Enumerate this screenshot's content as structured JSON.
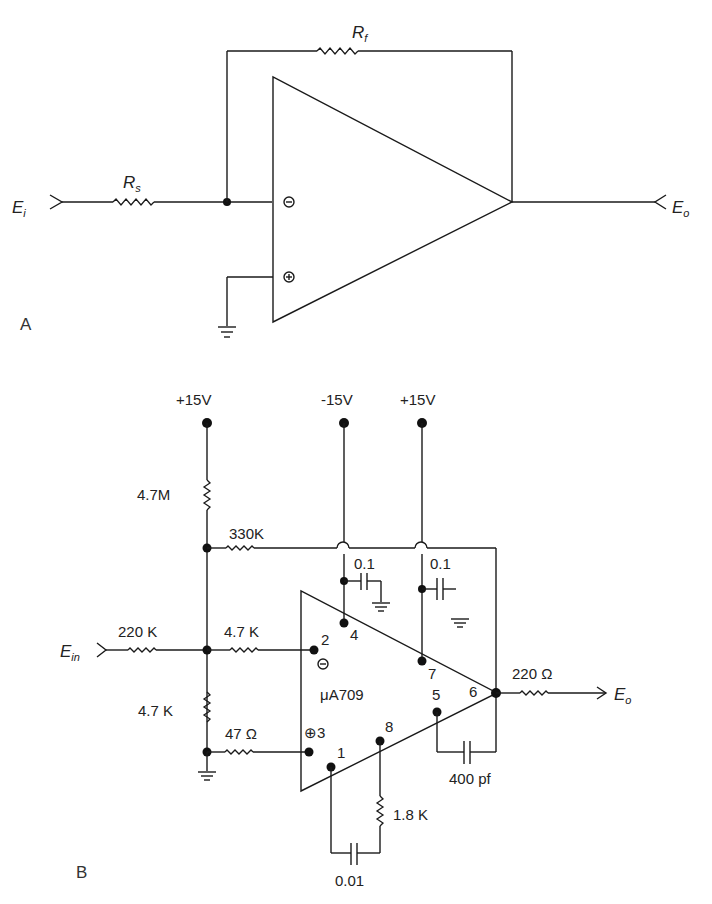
{
  "figure_a": {
    "panel_label": "A",
    "input_label": "E",
    "input_sub": "i",
    "output_label": "E",
    "output_sub": "o",
    "rs_label": "R",
    "rs_sub": "s",
    "rf_label": "R",
    "rf_sub": "f",
    "inverting_symbol": "⊖",
    "noninverting_symbol": "⊕"
  },
  "figure_b": {
    "panel_label": "B",
    "supply_left": "+15V",
    "supply_neg": "-15V",
    "supply_pos": "+15V",
    "r_top": "4.7M",
    "r_330k": "330K",
    "c_neg": "0.1",
    "c_pos": "0.1",
    "input_label": "E",
    "input_sub": "in",
    "r_in": "220 K",
    "r_series": "4.7 K",
    "r_bottom": "4.7 K",
    "r_47": "47 Ω",
    "chip": "μA709",
    "pin2": "2",
    "pin3": "⊕3",
    "pin4": "4",
    "pin7": "7",
    "pin5": "5",
    "pin6": "6",
    "pin8": "8",
    "pin1": "1",
    "inv_symbol": "⊖",
    "r_out": "220 Ω",
    "output_label": "E",
    "output_sub": "o",
    "c_400": "400 pf",
    "r_18k": "1.8 K",
    "c_001": "0.01"
  }
}
